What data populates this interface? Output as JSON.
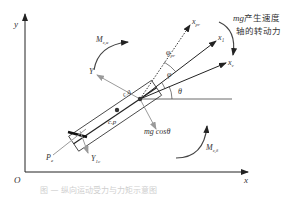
{
  "diagram": {
    "axes": {
      "origin": "O",
      "x_axis": "x",
      "y_axis": "y"
    },
    "body_axes": {
      "x1": "x₁",
      "Y_axis": "Y",
      "xpr": "x",
      "xpr_sub": "pr",
      "xv": "x",
      "xv_sub": "v"
    },
    "angles": {
      "theta": "θ",
      "phi": "φ",
      "phi_pr": "φ",
      "phi_pr_sub": "pr"
    },
    "points": {
      "center_of_gravity": "c.g",
      "center_of_pressure": "c.p"
    },
    "forces": {
      "gravity_component": "mg cosθ",
      "thrust": "P",
      "thrust_sub": "e",
      "control_force": "Y",
      "control_force_sub": "1c"
    },
    "moments": {
      "upper_moment": "M",
      "upper_moment_sub": "z,α",
      "lower_moment": "M",
      "lower_moment_sub": "z,δ"
    },
    "annotation": {
      "line1_prefix": "mg",
      "line1_text": "产生速度",
      "line2_text": "轴的转动力"
    },
    "caption": "图 — 纵向运动受力与力矩示意图"
  }
}
